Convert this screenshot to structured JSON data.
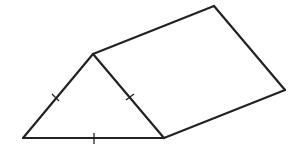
{
  "diagram": {
    "type": "triangular-prism",
    "colors": {
      "stroke": "#222222",
      "background": "#ffffff"
    },
    "vertices": {
      "A": [
        23,
        138
      ],
      "B": [
        93,
        54
      ],
      "C": [
        164,
        138
      ],
      "D": [
        214,
        6
      ],
      "E": [
        285,
        90
      ]
    },
    "edges": [
      {
        "name": "triangle-left-side",
        "from": "A",
        "to": "B",
        "tick": true
      },
      {
        "name": "triangle-right-side",
        "from": "B",
        "to": "C",
        "tick": true
      },
      {
        "name": "triangle-base",
        "from": "A",
        "to": "C",
        "tick": true
      },
      {
        "name": "top-edge",
        "from": "B",
        "to": "D",
        "tick": false
      },
      {
        "name": "back-right-edge",
        "from": "D",
        "to": "E",
        "tick": false
      },
      {
        "name": "bottom-right-edge",
        "from": "C",
        "to": "E",
        "tick": false
      }
    ],
    "tick_marks": 3
  }
}
